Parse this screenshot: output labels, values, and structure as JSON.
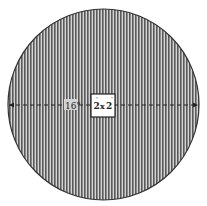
{
  "diagram": {
    "shape": "circle",
    "fill_pattern": "vertical-hatch",
    "colors": {
      "background": "#ffffff",
      "hatch": "#5a5a5a",
      "outline": "#333333",
      "square_fill": "#ffffff"
    },
    "diameter_label": "16\"",
    "center_square": {
      "width_label": "2",
      "times": "x",
      "height_label": "2",
      "unit_mark": "\""
    }
  }
}
